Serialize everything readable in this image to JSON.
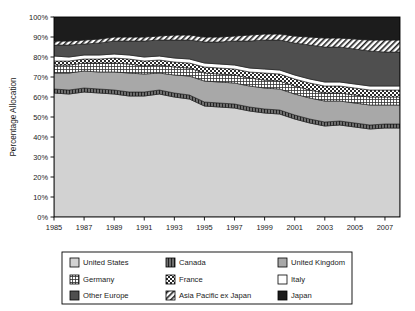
{
  "chart_data": {
    "type": "area",
    "stacked": true,
    "title": "",
    "xlabel": "",
    "ylabel": "Percentage Allocation",
    "ylim": [
      0,
      100
    ],
    "ytick_labels": [
      "0%",
      "10%",
      "20%",
      "30%",
      "40%",
      "50%",
      "60%",
      "70%",
      "80%",
      "90%",
      "100%"
    ],
    "ytick_values": [
      0,
      10,
      20,
      30,
      40,
      50,
      60,
      70,
      80,
      90,
      100
    ],
    "xtick_labels": [
      "1985",
      "1987",
      "1989",
      "1991",
      "1993",
      "1995",
      "1997",
      "1999",
      "2001",
      "2003",
      "2005",
      "2007"
    ],
    "xtick_values": [
      1985,
      1987,
      1989,
      1991,
      1993,
      1995,
      1997,
      1999,
      2001,
      2003,
      2005,
      2007
    ],
    "xlim": [
      1985,
      2008
    ],
    "grid": false,
    "legend_position": "bottom",
    "x": [
      1985,
      1986,
      1987,
      1988,
      1989,
      1990,
      1991,
      1992,
      1993,
      1994,
      1995,
      1996,
      1997,
      1998,
      1999,
      2000,
      2001,
      2002,
      2003,
      2004,
      2005,
      2006,
      2007,
      2008
    ],
    "series": [
      {
        "name": "United States",
        "pattern": "solid",
        "color": "#d2d2d2",
        "values": [
          62.0,
          61.5,
          62.5,
          62.0,
          61.5,
          60.5,
          60.5,
          61.5,
          60.0,
          59.0,
          55.5,
          55.0,
          54.5,
          53.0,
          52.0,
          51.5,
          49.0,
          47.0,
          45.5,
          46.0,
          45.0,
          44.0,
          44.5,
          44.5
        ]
      },
      {
        "name": "Canada",
        "pattern": "vertical-lines",
        "color": "#6e6e6e",
        "values": [
          2.0,
          2.0,
          2.0,
          2.0,
          2.0,
          2.0,
          2.0,
          2.0,
          2.0,
          2.0,
          2.0,
          2.0,
          2.0,
          2.0,
          2.0,
          2.0,
          2.0,
          2.0,
          2.0,
          2.0,
          2.0,
          2.0,
          2.0,
          2.0
        ]
      },
      {
        "name": "United Kingdom",
        "pattern": "solid",
        "color": "#a8a8a8",
        "values": [
          8.0,
          8.5,
          8.5,
          8.5,
          9.0,
          9.5,
          9.0,
          8.5,
          9.0,
          9.5,
          10.5,
          10.5,
          10.5,
          10.5,
          10.5,
          10.5,
          10.5,
          10.5,
          10.5,
          10.0,
          10.0,
          10.0,
          9.5,
          9.5
        ]
      },
      {
        "name": "Germany",
        "pattern": "grid",
        "color": "#ffffff",
        "values": [
          4.0,
          4.0,
          4.0,
          4.5,
          4.5,
          4.5,
          4.0,
          4.0,
          4.0,
          4.0,
          4.0,
          4.0,
          4.0,
          4.0,
          4.0,
          4.0,
          4.0,
          4.0,
          4.0,
          4.0,
          4.0,
          4.0,
          4.0,
          4.0
        ]
      },
      {
        "name": "France",
        "pattern": "checkerboard",
        "color": "#4d4d4d",
        "values": [
          2.0,
          2.0,
          2.0,
          2.0,
          2.5,
          2.5,
          2.5,
          2.5,
          2.5,
          2.5,
          3.0,
          3.0,
          3.0,
          3.0,
          3.5,
          3.5,
          3.5,
          3.5,
          3.5,
          3.5,
          3.5,
          3.5,
          3.5,
          3.5
        ]
      },
      {
        "name": "Italy",
        "pattern": "solid",
        "color": "#ffffff",
        "values": [
          2.5,
          2.0,
          2.0,
          2.0,
          2.0,
          2.0,
          2.0,
          2.0,
          2.0,
          2.0,
          2.0,
          2.0,
          2.0,
          2.0,
          2.0,
          2.0,
          2.0,
          2.0,
          2.0,
          2.0,
          2.0,
          2.0,
          2.0,
          2.0
        ]
      },
      {
        "name": "Other Europe",
        "pattern": "solid",
        "color": "#4f4f4f",
        "values": [
          5.5,
          6.0,
          5.5,
          6.0,
          6.5,
          7.0,
          8.0,
          8.0,
          9.0,
          9.5,
          10.5,
          11.0,
          12.0,
          13.5,
          14.5,
          15.0,
          16.0,
          17.0,
          17.5,
          17.5,
          17.5,
          17.5,
          17.0,
          17.0
        ]
      },
      {
        "name": "Asia Pacific ex Japan",
        "pattern": "diagonal",
        "color": "#ffffff",
        "values": [
          2.0,
          2.0,
          2.0,
          2.0,
          2.0,
          2.0,
          2.0,
          2.0,
          2.5,
          2.5,
          2.5,
          2.5,
          2.5,
          3.0,
          3.0,
          3.0,
          3.5,
          4.0,
          4.5,
          4.5,
          5.0,
          5.5,
          6.0,
          6.0
        ]
      },
      {
        "name": "Japan",
        "pattern": "solid",
        "color": "#1c1c1c",
        "values": [
          12.0,
          12.0,
          11.5,
          11.0,
          10.0,
          10.0,
          10.0,
          9.5,
          9.0,
          9.0,
          10.0,
          10.0,
          9.5,
          9.0,
          8.5,
          8.5,
          9.5,
          10.0,
          10.5,
          10.5,
          11.0,
          11.5,
          11.5,
          11.5
        ]
      }
    ]
  },
  "legend": {
    "entries": [
      {
        "label": "United States"
      },
      {
        "label": "Canada"
      },
      {
        "label": "United Kingdom"
      },
      {
        "label": "Germany"
      },
      {
        "label": "France"
      },
      {
        "label": "Italy"
      },
      {
        "label": "Other Europe"
      },
      {
        "label": "Asia Pacific ex Japan"
      },
      {
        "label": "Japan"
      }
    ]
  }
}
